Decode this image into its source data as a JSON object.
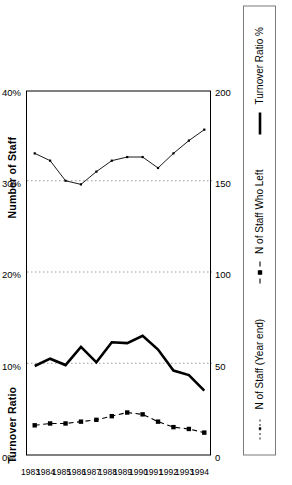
{
  "chart_data": {
    "type": "line",
    "title": "",
    "titles": {
      "left_axis": "Number of Staff",
      "right_axis": "Turnover Ratio"
    },
    "orientation": "rotated-90-ccw",
    "categories": [
      "1983",
      "1984",
      "1985",
      "1986",
      "1987",
      "1988",
      "1989",
      "1990",
      "1991",
      "1992",
      "1993",
      "1994"
    ],
    "xlabel": "",
    "axes": [
      {
        "name": "Number of Staff",
        "position": "primary",
        "ticks": [
          "0",
          "50",
          "100",
          "150",
          "200"
        ],
        "values": [
          0,
          50,
          100,
          150,
          200
        ],
        "ylim": [
          0,
          200
        ]
      },
      {
        "name": "Turnover Ratio",
        "position": "secondary",
        "ticks": [
          "0%",
          "10%",
          "20%",
          "30%",
          "40%"
        ],
        "values": [
          0,
          10,
          20,
          30,
          40
        ],
        "ylim": [
          0,
          40
        ]
      }
    ],
    "grid": "vertical-dotted-at-10-20-30-percent",
    "legend_position": "bottom",
    "series": [
      {
        "name": "N of Staff (Year end)",
        "axis": "Number of Staff",
        "style": "thin-line-small-square-markers",
        "values": [
          165,
          161,
          150,
          148,
          155,
          161,
          163,
          163,
          157,
          165,
          172,
          178
        ]
      },
      {
        "name": "N of Staff Who Left",
        "axis": "Number of Staff",
        "style": "dashed-line-filled-square-markers",
        "values": [
          16,
          17,
          17,
          18,
          19,
          21,
          23,
          22,
          18,
          15,
          14,
          12
        ]
      },
      {
        "name": "Turnover Ratio %",
        "axis": "Turnover Ratio",
        "style": "thick-solid-line-no-markers",
        "values": [
          9.7,
          10.5,
          9.8,
          11.8,
          10.1,
          12.3,
          12.2,
          13.0,
          11.5,
          9.2,
          8.7,
          7.0
        ]
      }
    ]
  },
  "legend": {
    "entries": [
      {
        "label": "N of Staff (Year end)",
        "symbol": "thin-dotted-line-marker"
      },
      {
        "label": "N of Staff Who Left",
        "symbol": "dashed-line-square-marker"
      },
      {
        "label": "Turnover Ratio %",
        "symbol": "thick-solid-line"
      }
    ]
  }
}
